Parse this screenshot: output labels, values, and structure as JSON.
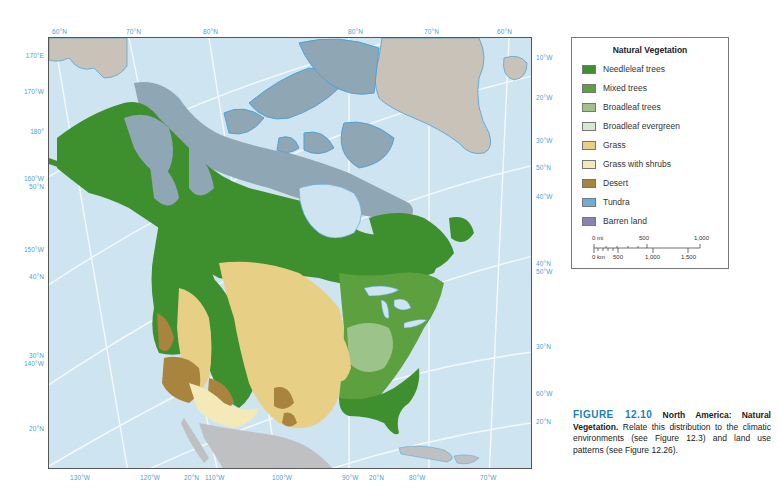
{
  "map": {
    "title": "North America: Natural Vegetation",
    "colors": {
      "ocean": "#cfe4f1",
      "graticule": "#ffffff",
      "non_data_land": "#c8c2b8",
      "mexico_land": "#bfc0c2"
    },
    "top_labels": [
      {
        "text": "60°N",
        "x": 52
      },
      {
        "text": "70°N",
        "x": 126
      },
      {
        "text": "80°N",
        "x": 203
      },
      {
        "text": "80°N",
        "x": 348
      },
      {
        "text": "70°N",
        "x": 424
      },
      {
        "text": "60°N",
        "x": 497
      }
    ],
    "left_labels": [
      {
        "text": "170°E",
        "y": 55
      },
      {
        "text": "170°W",
        "y": 91
      },
      {
        "text": "180°",
        "y": 131
      },
      {
        "text": "160°W",
        "y": 178
      },
      {
        "text": "50°N",
        "y": 186
      },
      {
        "text": "150°W",
        "y": 249
      },
      {
        "text": "40°N",
        "y": 276
      },
      {
        "text": "30°N",
        "y": 355
      },
      {
        "text": "140°W",
        "y": 363
      },
      {
        "text": "20°N",
        "y": 428
      }
    ],
    "right_labels": [
      {
        "text": "10°W",
        "y": 57
      },
      {
        "text": "20°W",
        "y": 97
      },
      {
        "text": "30°W",
        "y": 140
      },
      {
        "text": "50°N",
        "y": 167
      },
      {
        "text": "40°W",
        "y": 196
      },
      {
        "text": "40°N",
        "y": 263
      },
      {
        "text": "50°W",
        "y": 271
      },
      {
        "text": "30°N",
        "y": 346
      },
      {
        "text": "60°W",
        "y": 393
      },
      {
        "text": "20°N",
        "y": 421
      }
    ],
    "bottom_labels": [
      {
        "text": "130°W",
        "x": 70
      },
      {
        "text": "120°W",
        "x": 140
      },
      {
        "text": "20°N",
        "x": 184
      },
      {
        "text": "110°W",
        "x": 205
      },
      {
        "text": "100°W",
        "x": 272
      },
      {
        "text": "90°W",
        "x": 342
      },
      {
        "text": "20°N",
        "x": 369
      },
      {
        "text": "80°W",
        "x": 409
      },
      {
        "text": "70°W",
        "x": 480
      }
    ]
  },
  "legend": {
    "title": "Natural Vegetation",
    "items": [
      {
        "label": "Needleleaf trees",
        "color": "#3e8f2e"
      },
      {
        "label": "Mixed trees",
        "color": "#5ca040"
      },
      {
        "label": "Broadleaf trees",
        "color": "#9cc48a"
      },
      {
        "label": "Broadleaf evergreen",
        "color": "#d6e8d4"
      },
      {
        "label": "Grass",
        "color": "#e8cf86"
      },
      {
        "label": "Grass with shrubs",
        "color": "#f4eab8"
      },
      {
        "label": "Desert",
        "color": "#a8843e"
      },
      {
        "label": "Tundra",
        "color": "#6aaee0"
      },
      {
        "label": "Barren land",
        "color": "#8883b0"
      }
    ],
    "scale": {
      "mi_labels": [
        "0 mi",
        "500",
        "1,000"
      ],
      "km_labels": [
        "0 km",
        "500",
        "1,000",
        "1,500"
      ]
    }
  },
  "caption": {
    "figure_number": "FIGURE 12.10",
    "title": "North America: Natural Vegetation.",
    "body": "Relate this distribution to the climatic environments (see Figure 12.3) and land use patterns (see Figure 12.26)."
  }
}
